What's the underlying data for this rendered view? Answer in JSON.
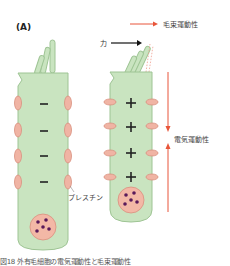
{
  "figure": {
    "panel_label": "(A)",
    "legend": {
      "arrow_color": "#e8553a",
      "text": "毛束運動性"
    },
    "force_label": "力",
    "electromotility_label": "電気運動性",
    "prestin_label": "プレスチン",
    "caption_partial": "図18 外有毛細胞の電気運動性と毛束運動性",
    "colors": {
      "cell_fill": "#c9e4c0",
      "cell_stroke": "#9ec494",
      "prestin_fill": "#f0b4a4",
      "prestin_stroke": "#d98f7e",
      "nucleus_fill": "#f3b8a6",
      "nucleus_dots": "#5a1a5a",
      "red_arrow": "#e8553a"
    },
    "left_cell": {
      "state": "depolarized-elongated",
      "charge_signs": [
        "−",
        "−",
        "−",
        "−"
      ]
    },
    "right_cell": {
      "state": "contracted",
      "charge_signs": [
        "+",
        "+",
        "+",
        "+"
      ]
    }
  }
}
